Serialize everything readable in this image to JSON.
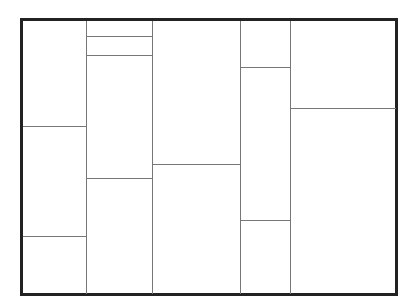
{
  "diagram": {
    "type": "rectangle-partition",
    "frame": {
      "x": 20,
      "y": 18,
      "w": 378,
      "h": 278,
      "border_color": "#222222",
      "line_color": "#777777"
    },
    "columns": [
      {
        "x0": 23,
        "x1": 86,
        "splits": [
          126,
          236
        ]
      },
      {
        "x0": 86,
        "x1": 152,
        "splits": [
          36,
          55,
          178
        ]
      },
      {
        "x0": 152,
        "x1": 240,
        "splits": [
          164
        ]
      },
      {
        "x0": 240,
        "x1": 290,
        "splits": [
          67,
          220
        ]
      },
      {
        "x0": 290,
        "x1": 395,
        "splits": [
          108
        ]
      }
    ]
  }
}
